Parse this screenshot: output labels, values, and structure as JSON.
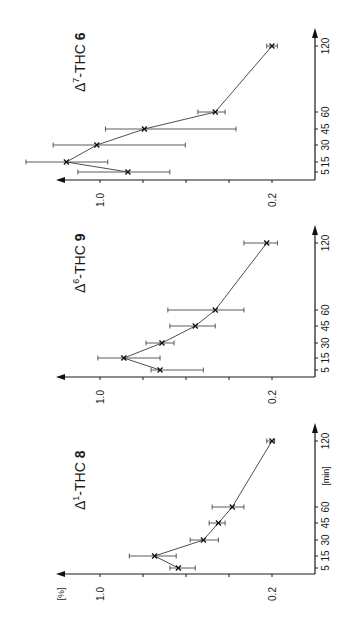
{
  "figure": {
    "rotation_deg": -90,
    "panels_stacked": "vertical"
  },
  "chart_data": [
    {
      "type": "line",
      "title": "Δ7-THC 6",
      "title_parts": {
        "prefix": "Δ",
        "superscript": "7",
        "suffix": "-THC",
        "compound_number": "6"
      },
      "xlabel": "",
      "ylabel": "",
      "x": [
        5,
        15,
        30,
        45,
        60,
        120
      ],
      "x_tick_labels": [
        "5",
        "15",
        "30",
        "45",
        "60",
        "120"
      ],
      "y_tick_labels": [
        "1.0",
        "0.2"
      ],
      "y_scale": "log",
      "series": [
        {
          "name": "Δ7-THC 6",
          "values": [
            0.77,
            1.37,
            1.03,
            0.66,
            0.34,
            0.2
          ],
          "error_low": [
            1.23,
            0.93,
            0.45,
            0.28,
            0.31,
            0.19
          ],
          "error_high": [
            0.52,
            2.0,
            1.55,
            0.95,
            0.4,
            0.21
          ]
        }
      ]
    },
    {
      "type": "line",
      "title": "Δ6-THC 9",
      "title_parts": {
        "prefix": "Δ",
        "superscript": "6",
        "suffix": "-THC",
        "compound_number": "9"
      },
      "xlabel": "",
      "ylabel": "",
      "x": [
        5,
        15,
        30,
        45,
        60,
        120
      ],
      "x_tick_labels": [
        "5",
        "15",
        "30",
        "45",
        "60",
        "120"
      ],
      "y_tick_labels": [
        "1.0",
        "0.2"
      ],
      "y_scale": "log",
      "series": [
        {
          "name": "Δ6-THC 9",
          "values": [
            0.57,
            0.8,
            0.56,
            0.41,
            0.34,
            0.21
          ],
          "error_low": [
            0.38,
            0.57,
            0.5,
            0.34,
            0.26,
            0.19
          ],
          "error_high": [
            0.62,
            1.02,
            0.65,
            0.52,
            0.53,
            0.26
          ]
        }
      ]
    },
    {
      "type": "line",
      "title": "Δ1-THC 8",
      "title_parts": {
        "prefix": "Δ",
        "superscript": "1",
        "suffix": "-THC",
        "compound_number": "8"
      },
      "xlabel": "[min]",
      "ylabel": "[%]",
      "x": [
        5,
        15,
        30,
        45,
        60,
        120
      ],
      "x_tick_labels": [
        "5",
        "15",
        "30",
        "45",
        "60",
        "120"
      ],
      "y_tick_labels": [
        "1.0",
        "0.2"
      ],
      "y_scale": "log",
      "series": [
        {
          "name": "Δ1-THC 8",
          "values": [
            0.48,
            0.6,
            0.38,
            0.33,
            0.29,
            0.2
          ],
          "error_low": [
            0.41,
            0.49,
            0.33,
            0.31,
            0.26,
            0.195
          ],
          "error_high": [
            0.52,
            0.76,
            0.43,
            0.36,
            0.35,
            0.21
          ]
        }
      ]
    }
  ],
  "layout": {
    "panels": [
      {
        "baseline_y": 180,
        "t_pos": {
          "5": 172,
          "15": 162,
          "30": 145,
          "45": 129,
          "60": 112,
          "120": 46
        },
        "arrow_top": 28,
        "title_x": 85,
        "title_y": 92,
        "show_units": false
      },
      {
        "baseline_y": 377,
        "t_pos": {
          "5": 370,
          "15": 358,
          "30": 343,
          "45": 326,
          "60": 310,
          "120": 243
        },
        "arrow_top": 225,
        "title_x": 85,
        "title_y": 293,
        "show_units": false
      },
      {
        "baseline_y": 574,
        "t_pos": {
          "5": 568,
          "15": 556,
          "30": 540,
          "45": 523,
          "60": 507,
          "120": 441
        },
        "arrow_top": 423,
        "title_x": 85,
        "title_y": 510,
        "show_units": true
      }
    ],
    "value_axis": {
      "x_1_0": 100,
      "px_per_log_decade": 246,
      "arrow_left": 56,
      "origin_x": 315,
      "tick_xs": [
        100,
        143,
        186,
        229,
        272
      ]
    }
  }
}
